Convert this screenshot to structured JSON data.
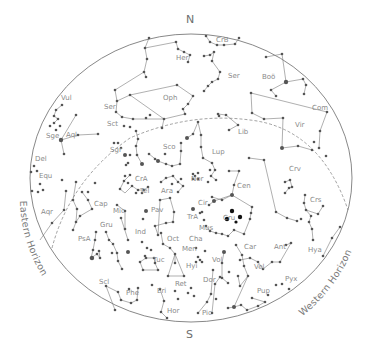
{
  "chart": {
    "colors": {
      "background": "#ffffff",
      "border": "#7a7a7a",
      "star": "#555555",
      "highlight_star": "#111111",
      "label": "#8a8a8a"
    },
    "ellipse": {
      "cx": 191,
      "cy": 178,
      "rx": 161,
      "ry": 144
    },
    "ecliptic": "M 52 248 Q 70 180 130 138 Q 190 112 250 120 Q 320 128 348 210"
  },
  "cardinals": {
    "north": "N",
    "south": "S"
  },
  "horizons": {
    "eastern": "Eastern Horizon",
    "western": "Western Horizon"
  },
  "constellations": [
    {
      "abbr": "CrB",
      "x": 216,
      "y": 42
    },
    {
      "abbr": "Her",
      "x": 176,
      "y": 60
    },
    {
      "abbr": "Ser",
      "x": 228,
      "y": 78
    },
    {
      "abbr": "Boö",
      "x": 262,
      "y": 79
    },
    {
      "abbr": "Oph",
      "x": 163,
      "y": 100
    },
    {
      "abbr": "Com",
      "x": 312,
      "y": 110
    },
    {
      "abbr": "Vul",
      "x": 61,
      "y": 100
    },
    {
      "abbr": "Ser",
      "x": 104,
      "y": 109
    },
    {
      "abbr": "Sct",
      "x": 107,
      "y": 126
    },
    {
      "abbr": "Vir",
      "x": 295,
      "y": 127
    },
    {
      "abbr": "Lib",
      "x": 238,
      "y": 134
    },
    {
      "abbr": "Sge",
      "x": 46,
      "y": 138
    },
    {
      "abbr": "Aql",
      "x": 66,
      "y": 137
    },
    {
      "abbr": "Sgr",
      "x": 110,
      "y": 152
    },
    {
      "abbr": "Sco",
      "x": 163,
      "y": 149
    },
    {
      "abbr": "Lup",
      "x": 212,
      "y": 154
    },
    {
      "abbr": "Del",
      "x": 35,
      "y": 161
    },
    {
      "abbr": "Equ",
      "x": 39,
      "y": 178
    },
    {
      "abbr": "CrA",
      "x": 135,
      "y": 181
    },
    {
      "abbr": "Nor",
      "x": 191,
      "y": 181
    },
    {
      "abbr": "Cen",
      "x": 237,
      "y": 188
    },
    {
      "abbr": "Crv",
      "x": 289,
      "y": 171
    },
    {
      "abbr": "Tel",
      "x": 140,
      "y": 193
    },
    {
      "abbr": "Ara",
      "x": 161,
      "y": 193
    },
    {
      "abbr": "Crs",
      "x": 310,
      "y": 202
    },
    {
      "abbr": "Aqr",
      "x": 41,
      "y": 214
    },
    {
      "abbr": "Cap",
      "x": 94,
      "y": 206
    },
    {
      "abbr": "Cir",
      "x": 198,
      "y": 205
    },
    {
      "abbr": "Mic",
      "x": 113,
      "y": 213
    },
    {
      "abbr": "Pav",
      "x": 151,
      "y": 212
    },
    {
      "abbr": "TrA",
      "x": 187,
      "y": 219
    },
    {
      "abbr": "Cru",
      "x": 223,
      "y": 220
    },
    {
      "abbr": "Mus",
      "x": 199,
      "y": 230
    },
    {
      "abbr": "Gru",
      "x": 100,
      "y": 227
    },
    {
      "abbr": "PsA",
      "x": 78,
      "y": 241
    },
    {
      "abbr": "Ind",
      "x": 135,
      "y": 234
    },
    {
      "abbr": "Oct",
      "x": 167,
      "y": 241
    },
    {
      "abbr": "Cha",
      "x": 189,
      "y": 241
    },
    {
      "abbr": "Men",
      "x": 182,
      "y": 251
    },
    {
      "abbr": "Car",
      "x": 244,
      "y": 249
    },
    {
      "abbr": "Ant",
      "x": 274,
      "y": 249
    },
    {
      "abbr": "Hya",
      "x": 308,
      "y": 252
    },
    {
      "abbr": "Vol",
      "x": 212,
      "y": 262
    },
    {
      "abbr": "Tuc",
      "x": 153,
      "y": 262
    },
    {
      "abbr": "Vel",
      "x": 254,
      "y": 269
    },
    {
      "abbr": "Hyi",
      "x": 186,
      "y": 268
    },
    {
      "abbr": "Scl",
      "x": 99,
      "y": 284
    },
    {
      "abbr": "Dor",
      "x": 203,
      "y": 282
    },
    {
      "abbr": "Pyx",
      "x": 285,
      "y": 281
    },
    {
      "abbr": "Ret",
      "x": 175,
      "y": 286
    },
    {
      "abbr": "Eri",
      "x": 157,
      "y": 293
    },
    {
      "abbr": "Phe",
      "x": 126,
      "y": 295
    },
    {
      "abbr": "Pup",
      "x": 257,
      "y": 293
    },
    {
      "abbr": "Hor",
      "x": 167,
      "y": 313
    },
    {
      "abbr": "Pic",
      "x": 202,
      "y": 315
    }
  ],
  "stars": [
    [
      149,
      38,
      1.3
    ],
    [
      176,
      42,
      1.3
    ],
    [
      206,
      36,
      1.3
    ],
    [
      210,
      42,
      1.3
    ],
    [
      217,
      45,
      1.3
    ],
    [
      224,
      45,
      1.3
    ],
    [
      235,
      44,
      1.3
    ],
    [
      239,
      38,
      1.3
    ],
    [
      145,
      48,
      1.3
    ],
    [
      178,
      49,
      1.3
    ],
    [
      184,
      52,
      1.3
    ],
    [
      190,
      55,
      1.3
    ],
    [
      188,
      62,
      1.3
    ],
    [
      147,
      59,
      1.3
    ],
    [
      144,
      72,
      1.3
    ],
    [
      146,
      77,
      1.3
    ],
    [
      204,
      56,
      1.3
    ],
    [
      210,
      55,
      1.3
    ],
    [
      214,
      52,
      1.3
    ],
    [
      212,
      61,
      1.3
    ],
    [
      220,
      72,
      1.3
    ],
    [
      218,
      79,
      1.3
    ],
    [
      212,
      82,
      1.3
    ],
    [
      208,
      86,
      1.3
    ],
    [
      204,
      91,
      1.3
    ],
    [
      266,
      57,
      1.3
    ],
    [
      282,
      54,
      1.3
    ],
    [
      286,
      82,
      2.2
    ],
    [
      271,
      90,
      1.3
    ],
    [
      276,
      96,
      1.3
    ],
    [
      303,
      79,
      1.3
    ],
    [
      306,
      85,
      1.3
    ],
    [
      304,
      94,
      1.3
    ],
    [
      115,
      90,
      1.3
    ],
    [
      117,
      101,
      1.3
    ],
    [
      130,
      95,
      1.3
    ],
    [
      177,
      85,
      1.3
    ],
    [
      193,
      96,
      1.3
    ],
    [
      188,
      104,
      1.3
    ],
    [
      183,
      109,
      1.3
    ],
    [
      185,
      114,
      1.3
    ],
    [
      164,
      119,
      1.3
    ],
    [
      162,
      128,
      1.3
    ],
    [
      116,
      112,
      1.3
    ],
    [
      122,
      117,
      1.3
    ],
    [
      133,
      119,
      1.3
    ],
    [
      146,
      118,
      1.3
    ],
    [
      150,
      115,
      1.3
    ],
    [
      124,
      126,
      1.3
    ],
    [
      130,
      127,
      1.3
    ],
    [
      136,
      131,
      1.3
    ],
    [
      138,
      139,
      1.3
    ],
    [
      251,
      93,
      1.3
    ],
    [
      252,
      113,
      1.3
    ],
    [
      264,
      119,
      1.3
    ],
    [
      283,
      118,
      1.3
    ],
    [
      282,
      148,
      2
    ],
    [
      298,
      146,
      1.3
    ],
    [
      312,
      150,
      1.3
    ],
    [
      319,
      148,
      1.3
    ],
    [
      320,
      131,
      1.3
    ],
    [
      314,
      142,
      1.3
    ],
    [
      326,
      156,
      1.3
    ],
    [
      327,
      112,
      1.3
    ],
    [
      218,
      114,
      1.3
    ],
    [
      226,
      115,
      1.3
    ],
    [
      238,
      125,
      1.3
    ],
    [
      229,
      130,
      1.3
    ],
    [
      219,
      116,
      1.3
    ],
    [
      62,
      105,
      1.3
    ],
    [
      56,
      110,
      1.3
    ],
    [
      54,
      116,
      1.3
    ],
    [
      58,
      119,
      1.3
    ],
    [
      54,
      123,
      1.3
    ],
    [
      50,
      126,
      1.3
    ],
    [
      60,
      126,
      1.3
    ],
    [
      56,
      130,
      1.3
    ],
    [
      76,
      115,
      1.3
    ],
    [
      61,
      140,
      2.2
    ],
    [
      64,
      154,
      1.3
    ],
    [
      78,
      135,
      1.3
    ],
    [
      98,
      134,
      1.3
    ],
    [
      118,
      143,
      1.3
    ],
    [
      121,
      148,
      1.3
    ],
    [
      114,
      143,
      1.3
    ],
    [
      125,
      155,
      2
    ],
    [
      128,
      163,
      1.3
    ],
    [
      136,
      146,
      1.3
    ],
    [
      137,
      155,
      1.3
    ],
    [
      142,
      164,
      2
    ],
    [
      130,
      155,
      1.3
    ],
    [
      126,
      165,
      1.3
    ],
    [
      149,
      154,
      1.3
    ],
    [
      158,
      161,
      2
    ],
    [
      166,
      164,
      1.3
    ],
    [
      172,
      166,
      1.3
    ],
    [
      180,
      164,
      1.3
    ],
    [
      181,
      151,
      1.3
    ],
    [
      181,
      143,
      1.3
    ],
    [
      187,
      138,
      2
    ],
    [
      193,
      134,
      1.3
    ],
    [
      198,
      122,
      1.3
    ],
    [
      201,
      135,
      1.3
    ],
    [
      201,
      147,
      1.3
    ],
    [
      165,
      154,
      1.3
    ],
    [
      155,
      159,
      1.3
    ],
    [
      203,
      158,
      1.3
    ],
    [
      212,
      163,
      1.3
    ],
    [
      215,
      170,
      1.3
    ],
    [
      211,
      176,
      1.3
    ],
    [
      216,
      180,
      1.3
    ],
    [
      208,
      182,
      1.3
    ],
    [
      210,
      170,
      1.3
    ],
    [
      193,
      174,
      1.3
    ],
    [
      198,
      173,
      1.3
    ],
    [
      193,
      179,
      1.3
    ],
    [
      198,
      179,
      1.3
    ],
    [
      195,
      176,
      1.3
    ],
    [
      229,
      171,
      1.3
    ],
    [
      239,
      171,
      1.3
    ],
    [
      234,
      185,
      1.3
    ],
    [
      249,
      158,
      1.3
    ],
    [
      264,
      160,
      1.3
    ],
    [
      276,
      212,
      1.3
    ],
    [
      287,
      218,
      1.3
    ],
    [
      297,
      221,
      1.3
    ],
    [
      301,
      219,
      1.3
    ],
    [
      285,
      182,
      1.3
    ],
    [
      290,
      180,
      1.3
    ],
    [
      289,
      188,
      1.3
    ],
    [
      285,
      193,
      1.3
    ],
    [
      292,
      187,
      1.3
    ],
    [
      305,
      195,
      1.3
    ],
    [
      304,
      203,
      1.3
    ],
    [
      306,
      210,
      1.3
    ],
    [
      311,
      216,
      1.3
    ],
    [
      309,
      222,
      1.3
    ],
    [
      312,
      229,
      1.3
    ],
    [
      318,
      214,
      1.3
    ],
    [
      323,
      206,
      1.3
    ],
    [
      313,
      240,
      1.3
    ],
    [
      332,
      238,
      1.3
    ],
    [
      340,
      227,
      1.3
    ],
    [
      323,
      256,
      1.3
    ],
    [
      34,
      166,
      1.3
    ],
    [
      31,
      172,
      1.3
    ],
    [
      37,
      171,
      1.3
    ],
    [
      40,
      184,
      1.3
    ],
    [
      38,
      192,
      1.3
    ],
    [
      43,
      190,
      1.3
    ],
    [
      32,
      191,
      1.3
    ],
    [
      62,
      180,
      1.3
    ],
    [
      66,
      191,
      1.3
    ],
    [
      64,
      210,
      1.3
    ],
    [
      52,
      223,
      1.3
    ],
    [
      76,
      182,
      1.3
    ],
    [
      73,
      200,
      1.3
    ],
    [
      77,
      209,
      1.3
    ],
    [
      76,
      222,
      1.3
    ],
    [
      73,
      230,
      1.3
    ],
    [
      82,
      192,
      1.3
    ],
    [
      88,
      192,
      1.3
    ],
    [
      88,
      200,
      1.3
    ],
    [
      92,
      209,
      1.3
    ],
    [
      80,
      216,
      1.3
    ],
    [
      95,
      183,
      1.3
    ],
    [
      125,
      176,
      1.3
    ],
    [
      128,
      183,
      1.3
    ],
    [
      132,
      186,
      1.3
    ],
    [
      138,
      190,
      1.3
    ],
    [
      144,
      190,
      1.3
    ],
    [
      148,
      187,
      1.3
    ],
    [
      130,
      175,
      1.3
    ],
    [
      124,
      181,
      1.3
    ],
    [
      120,
      189,
      1.3
    ],
    [
      136,
      193,
      1.3
    ],
    [
      142,
      193,
      1.3
    ],
    [
      161,
      182,
      1.3
    ],
    [
      166,
      178,
      1.3
    ],
    [
      173,
      176,
      1.3
    ],
    [
      178,
      182,
      1.3
    ],
    [
      183,
      186,
      1.3
    ],
    [
      178,
      192,
      1.3
    ],
    [
      172,
      184,
      1.3
    ],
    [
      181,
      179,
      1.3
    ],
    [
      212,
      197,
      1.3
    ],
    [
      222,
      200,
      1.3
    ],
    [
      232,
      195,
      2
    ],
    [
      214,
      201,
      2
    ],
    [
      209,
      205,
      1.3
    ],
    [
      200,
      213,
      1.3
    ],
    [
      193,
      209,
      2
    ],
    [
      202,
      212,
      1.3
    ],
    [
      204,
      220,
      1.3
    ],
    [
      232,
      211,
      2.2
    ],
    [
      240,
      217,
      2.2
    ],
    [
      227,
      219,
      2.2
    ],
    [
      236,
      222,
      1.6
    ],
    [
      250,
      219,
      1.3
    ],
    [
      251,
      213,
      1.3
    ],
    [
      252,
      207,
      1.3
    ],
    [
      244,
      234,
      1.3
    ],
    [
      206,
      226,
      1.3
    ],
    [
      210,
      231,
      1.3
    ],
    [
      216,
      233,
      1.3
    ],
    [
      222,
      234,
      1.3
    ],
    [
      228,
      236,
      1.3
    ],
    [
      234,
      230,
      1.3
    ],
    [
      117,
      205,
      1.3
    ],
    [
      125,
      211,
      1.3
    ],
    [
      125,
      229,
      1.3
    ],
    [
      121,
      218,
      1.3
    ],
    [
      128,
      240,
      1.3
    ],
    [
      143,
      219,
      1.3
    ],
    [
      146,
      211,
      2
    ],
    [
      160,
      200,
      1.3
    ],
    [
      170,
      198,
      1.3
    ],
    [
      174,
      212,
      1.3
    ],
    [
      173,
      222,
      1.3
    ],
    [
      166,
      223,
      1.3
    ],
    [
      155,
      226,
      1.3
    ],
    [
      158,
      235,
      1.3
    ],
    [
      106,
      232,
      1.3
    ],
    [
      109,
      240,
      1.3
    ],
    [
      113,
      244,
      1.3
    ],
    [
      117,
      253,
      1.3
    ],
    [
      118,
      261,
      1.3
    ],
    [
      122,
      269,
      1.3
    ],
    [
      128,
      252,
      2
    ],
    [
      112,
      253,
      1.3
    ],
    [
      96,
      232,
      1.3
    ],
    [
      95,
      240,
      1.3
    ],
    [
      93,
      250,
      1.3
    ],
    [
      91,
      258,
      1.3
    ],
    [
      97,
      254,
      1.3
    ],
    [
      100,
      258,
      1.3
    ],
    [
      99,
      251,
      1.3
    ],
    [
      92,
      258,
      2.2
    ],
    [
      142,
      242,
      1.3
    ],
    [
      147,
      248,
      1.3
    ],
    [
      151,
      250,
      1.3
    ],
    [
      145,
      256,
      1.3
    ],
    [
      161,
      233,
      1.3
    ],
    [
      163,
      244,
      1.3
    ],
    [
      170,
      248,
      1.3
    ],
    [
      175,
      254,
      1.3
    ],
    [
      175,
      263,
      1.3
    ],
    [
      168,
      276,
      1.3
    ],
    [
      184,
      276,
      1.3
    ],
    [
      196,
      248,
      1.3
    ],
    [
      205,
      251,
      1.3
    ],
    [
      200,
      260,
      1.3
    ],
    [
      196,
      262,
      1.3
    ],
    [
      202,
      262,
      1.3
    ],
    [
      198,
      257,
      1.3
    ],
    [
      224,
      252,
      2
    ],
    [
      236,
      245,
      1.3
    ],
    [
      242,
      255,
      1.3
    ],
    [
      244,
      266,
      1.3
    ],
    [
      248,
      276,
      1.3
    ],
    [
      238,
      276,
      1.3
    ],
    [
      240,
      286,
      1.3
    ],
    [
      229,
      272,
      1.3
    ],
    [
      222,
      263,
      1.3
    ],
    [
      222,
      278,
      1.3
    ],
    [
      228,
      283,
      1.3
    ],
    [
      240,
      260,
      1.3
    ],
    [
      250,
      258,
      1.3
    ],
    [
      258,
      262,
      1.3
    ],
    [
      263,
      269,
      1.3
    ],
    [
      272,
      262,
      1.3
    ],
    [
      280,
      262,
      1.3
    ],
    [
      286,
      245,
      1.3
    ],
    [
      291,
      243,
      1.3
    ],
    [
      140,
      262,
      1.3
    ],
    [
      146,
      258,
      1.3
    ],
    [
      154,
      258,
      1.3
    ],
    [
      155,
      263,
      1.3
    ],
    [
      158,
      270,
      1.3
    ],
    [
      143,
      270,
      1.3
    ],
    [
      213,
      270,
      1.3
    ],
    [
      220,
      277,
      1.3
    ],
    [
      215,
      284,
      1.3
    ],
    [
      211,
      294,
      1.3
    ],
    [
      216,
      299,
      1.3
    ],
    [
      207,
      302,
      1.3
    ],
    [
      198,
      313,
      1.3
    ],
    [
      212,
      313,
      1.3
    ],
    [
      160,
      289,
      1.3
    ],
    [
      164,
      301,
      1.3
    ],
    [
      161,
      312,
      1.3
    ],
    [
      167,
      318,
      1.3
    ],
    [
      152,
      285,
      1.3
    ],
    [
      175,
      291,
      1.3
    ],
    [
      178,
      299,
      1.3
    ],
    [
      188,
      293,
      1.3
    ],
    [
      191,
      288,
      1.3
    ],
    [
      194,
      296,
      1.3
    ],
    [
      106,
      286,
      1.3
    ],
    [
      118,
      292,
      1.3
    ],
    [
      121,
      300,
      1.3
    ],
    [
      131,
      303,
      1.3
    ],
    [
      137,
      300,
      1.3
    ],
    [
      138,
      288,
      1.3
    ],
    [
      129,
      289,
      1.3
    ],
    [
      115,
      310,
      1.3
    ],
    [
      228,
      308,
      1.3
    ],
    [
      234,
      307,
      2
    ],
    [
      241,
      305,
      1.3
    ],
    [
      247,
      310,
      1.3
    ],
    [
      258,
      306,
      1.3
    ],
    [
      265,
      302,
      1.3
    ],
    [
      252,
      298,
      1.3
    ],
    [
      276,
      285,
      1.3
    ],
    [
      282,
      284,
      1.3
    ],
    [
      289,
      289,
      1.3
    ],
    [
      268,
      295,
      1.3
    ]
  ]
}
